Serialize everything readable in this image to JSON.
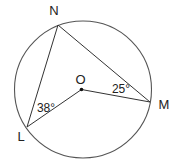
{
  "diagram": {
    "type": "circle-geometry",
    "circle": {
      "center": "O",
      "cx": 83,
      "cy": 89.5,
      "r": 68.5,
      "stroke": "#555555"
    },
    "points": {
      "N": {
        "label": "N",
        "x": 58,
        "y": 25,
        "label_x": 54,
        "label_y": 15
      },
      "L": {
        "label": "L",
        "x": 27,
        "y": 127,
        "label_x": 21,
        "label_y": 141
      },
      "M": {
        "label": "M",
        "x": 150,
        "y": 102,
        "label_x": 164,
        "label_y": 109
      },
      "O": {
        "label": "O",
        "x": 81.5,
        "y": 89.5,
        "label_x": 80.5,
        "label_y": 84
      }
    },
    "segments": [
      {
        "from": "N",
        "to": "L"
      },
      {
        "from": "N",
        "to": "M"
      },
      {
        "from": "O",
        "to": "L"
      },
      {
        "from": "O",
        "to": "M"
      }
    ],
    "angles": [
      {
        "vertex": "L",
        "label": "38°",
        "x": 46,
        "y": 112
      },
      {
        "vertex": "M",
        "label": "25°",
        "x": 121,
        "y": 93
      }
    ],
    "line_color": "#333333"
  }
}
